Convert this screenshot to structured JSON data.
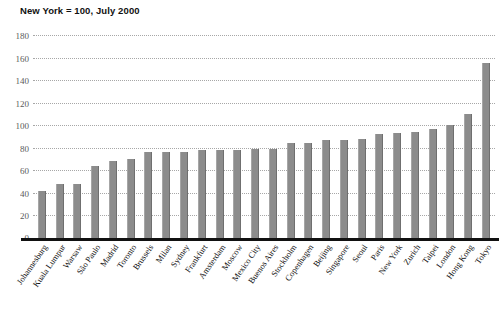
{
  "chart_data": {
    "type": "bar",
    "title": "New York = 100, July 2000",
    "xlabel": "",
    "ylabel": "",
    "ylim": [
      0,
      180
    ],
    "yticks": [
      180,
      160,
      140,
      120,
      100,
      80,
      60,
      40,
      20,
      0
    ],
    "grid": "dotted-horizontal",
    "legend": "none",
    "bar_color": "#8c8c8c",
    "categories": [
      "Johannesburg",
      "Kuala Lumpur",
      "Warsaw",
      "São Paulo",
      "Madrid",
      "Toronto",
      "Brussels",
      "Milan",
      "Sydney",
      "Frankfurt",
      "Amsterdam",
      "Moscow",
      "Mexico City",
      "Buenos Aires",
      "Stockholm",
      "Copenhagen",
      "Beijing",
      "Singapore",
      "Seoul",
      "Paris",
      "New York",
      "Zurich",
      "Taipei",
      "London",
      "Hong Kong",
      "Tokyo"
    ],
    "values": [
      42,
      48,
      48,
      64,
      68,
      70,
      76,
      76,
      76,
      78,
      78,
      78,
      79,
      79,
      84,
      84,
      87,
      87,
      88,
      92,
      93,
      94,
      97,
      100,
      110,
      155
    ]
  }
}
